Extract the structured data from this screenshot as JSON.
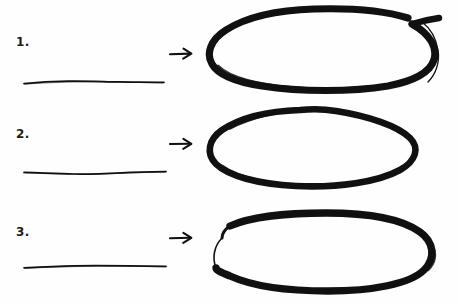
{
  "canvas": {
    "width": 458,
    "height": 306,
    "background_color": "#fefefe",
    "ink_color": "#111111",
    "style": "hand-drawn marker sketch"
  },
  "rows": [
    {
      "number_label": "1.",
      "baseline": {
        "name": "hand-drawn-horizontal-line",
        "description": "thin slightly wavy horizontal pen line",
        "length_px": 146,
        "thickness_px": 1.6
      },
      "arrow": {
        "name": "right-arrow",
        "glyph": "→",
        "direction": "right",
        "length_px": 26
      },
      "oval": {
        "name": "hand-drawn-oval",
        "shape": "rounded-oblong-with-overshoot-tail",
        "width_px": 245,
        "height_px": 88,
        "stroke_px": 7,
        "has_overshoot_tail": true,
        "tail_position": "top-right"
      }
    },
    {
      "number_label": "2.",
      "baseline": {
        "name": "hand-drawn-horizontal-line",
        "description": "thin slightly wavy horizontal pen line",
        "length_px": 146,
        "thickness_px": 1.6
      },
      "arrow": {
        "name": "right-arrow",
        "glyph": "→",
        "direction": "right",
        "length_px": 26
      },
      "oval": {
        "name": "hand-drawn-oval",
        "shape": "smooth-ellipse",
        "width_px": 228,
        "height_px": 88,
        "stroke_px": 6,
        "has_overshoot_tail": false,
        "tail_position": "none"
      }
    },
    {
      "number_label": "3.",
      "baseline": {
        "name": "hand-drawn-horizontal-line",
        "description": "thin slightly wavy horizontal pen line",
        "length_px": 146,
        "thickness_px": 1.6
      },
      "arrow": {
        "name": "right-arrow",
        "glyph": "→",
        "direction": "right",
        "length_px": 26
      },
      "oval": {
        "name": "hand-drawn-oval",
        "shape": "stadium-rounded-rectangle-tapered-start",
        "width_px": 242,
        "height_px": 86,
        "stroke_px": 7,
        "has_overshoot_tail": false,
        "tail_position": "none",
        "tapered_start": "left"
      }
    }
  ]
}
